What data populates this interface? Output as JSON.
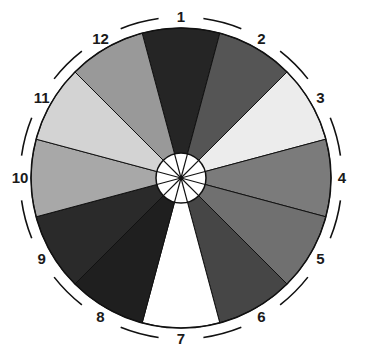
{
  "diagram": {
    "type": "segmented-wheel",
    "center": [
      181,
      178
    ],
    "outer_radius": 150,
    "ring_radius": 161,
    "hub_radius": 25,
    "segments": [
      {
        "label": "1",
        "color": "#252525"
      },
      {
        "label": "2",
        "color": "#555555"
      },
      {
        "label": "3",
        "color": "#ececec"
      },
      {
        "label": "4",
        "color": "#7b7b7b"
      },
      {
        "label": "5",
        "color": "#707070"
      },
      {
        "label": "6",
        "color": "#464646"
      },
      {
        "label": "7",
        "color": "#ffffff"
      },
      {
        "label": "8",
        "color": "#1f1f1f"
      },
      {
        "label": "9",
        "color": "#2a2a2a"
      },
      {
        "label": "10",
        "color": "#a8a8a8"
      },
      {
        "label": "11",
        "color": "#d3d3d3"
      },
      {
        "label": "12",
        "color": "#999999"
      }
    ],
    "hub_color": "#ffffff",
    "line_color": "#111111"
  }
}
